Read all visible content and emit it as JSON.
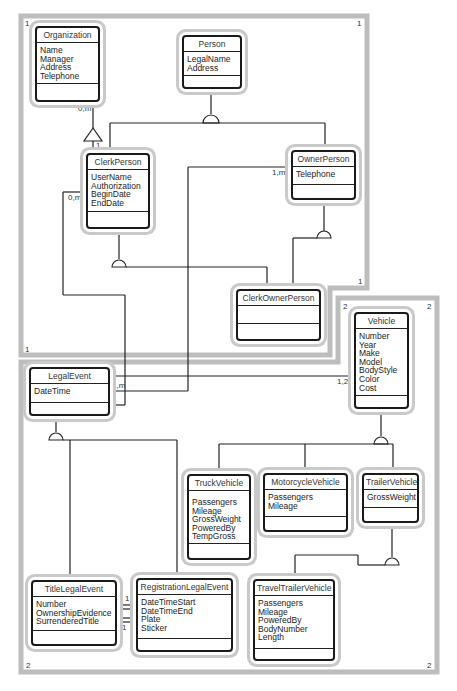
{
  "frames": [
    {
      "id": "1",
      "corner_labels": [
        "1",
        "1",
        "1",
        "1"
      ]
    },
    {
      "id": "2",
      "corner_labels": [
        "2",
        "2",
        "2",
        "2"
      ]
    }
  ],
  "classes": {
    "organization": {
      "name": "Organization",
      "attributes": [
        "Name",
        "Manager",
        "Address",
        "Telephone"
      ]
    },
    "person": {
      "name": "Person",
      "attributes": [
        "LegalName",
        "Address"
      ]
    },
    "clerk_person": {
      "name": "ClerkPerson",
      "attributes": [
        "UserName",
        "Authorization",
        "BeginDate",
        "EndDate"
      ]
    },
    "owner_person": {
      "name": "OwnerPerson",
      "attributes": [
        "Telephone"
      ]
    },
    "clerk_owner_person": {
      "name": "ClerkOwnerPerson",
      "attributes": []
    },
    "vehicle": {
      "name": "Vehicle",
      "attributes": [
        "Number",
        "Year",
        "Make",
        "Model",
        "BodyStyle",
        "Color",
        "Cost"
      ]
    },
    "legal_event": {
      "name": "LegalEvent",
      "attributes": [
        "DateTime"
      ]
    },
    "truck_vehicle": {
      "name": "TruckVehicle",
      "attributes": [
        "Passengers",
        "Mileage",
        "GrossWeight",
        "PoweredBy",
        "TempGross"
      ]
    },
    "motorcycle_vehicle": {
      "name": "MotorcycleVehicle",
      "attributes": [
        "Passengers",
        "Mileage"
      ]
    },
    "trailer_vehicle": {
      "name": "TrailerVehicle",
      "attributes": [
        "GrossWeight"
      ]
    },
    "title_legal_event": {
      "name": "TitleLegalEvent",
      "attributes": [
        "Number",
        "OwnershipEvidence",
        "SurrenderedTitle"
      ]
    },
    "registration_legal_event": {
      "name": "RegistrationLegalEvent",
      "attributes": [
        "DateTimeStart",
        "DateTimeEnd",
        "Plate",
        "Sticker"
      ]
    },
    "travel_trailer_vehicle": {
      "name": "TravelTrailerVehicle",
      "attributes": [
        "Passengers",
        "Mileage",
        "PoweredBy",
        "BodyNumber",
        "Length"
      ]
    }
  },
  "multiplicities": {
    "org_clerk_org_end": "0,m",
    "org_clerk_clerk_end": "1",
    "clerk_legal_clerk_end": "0,m",
    "owner_legal_owner_end": "1,m",
    "legal_vehicle_legal_end": "1",
    "legal_owner_legal_end": "1,m",
    "legal_clerk_legal_end": "1",
    "legal_vehicle_vehicle_end": "1,2",
    "title_reg_upper": "1",
    "title_reg_lower": "1"
  }
}
